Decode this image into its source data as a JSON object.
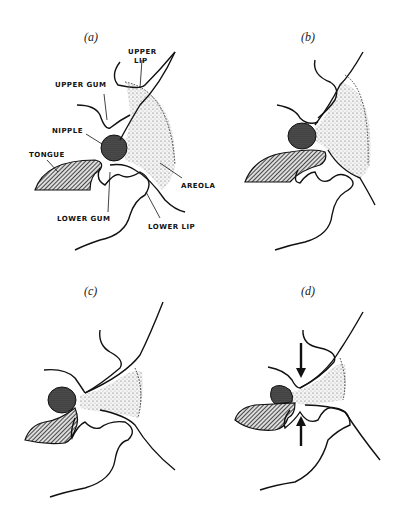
{
  "figure": {
    "panels": [
      {
        "id": "a",
        "caption": "(a)"
      },
      {
        "id": "b",
        "caption": "(b)"
      },
      {
        "id": "c",
        "caption": "(c)"
      },
      {
        "id": "d",
        "caption": "(d)"
      }
    ],
    "labels": {
      "upper_lip_1": "UPPER",
      "upper_lip_2": "LIP",
      "upper_gum": "UPPER GUM",
      "nipple": "NIPPLE",
      "tongue": "TONGUE",
      "areola": "AREOLA",
      "lower_gum": "LOWER GUM",
      "lower_lip": "LOWER LIP"
    },
    "colors": {
      "ink": "#111111",
      "background": "#ffffff"
    }
  }
}
